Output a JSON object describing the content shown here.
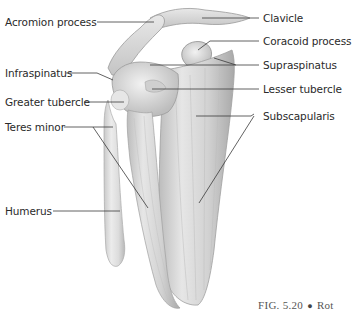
{
  "figure": {
    "labels_left": [
      {
        "id": "acromion",
        "text": "Acromion process",
        "x": 5,
        "y": 16
      },
      {
        "id": "infraspinatus",
        "text": "Infraspinatus",
        "x": 5,
        "y": 67
      },
      {
        "id": "greater-tubercle",
        "text": "Greater tubercle",
        "x": 5,
        "y": 96
      },
      {
        "id": "teres-minor",
        "text": "Teres minor",
        "x": 5,
        "y": 121
      },
      {
        "id": "humerus",
        "text": "Humerus",
        "x": 5,
        "y": 205
      }
    ],
    "labels_right": [
      {
        "id": "clavicle",
        "text": "Clavicle",
        "x": 263,
        "y": 12
      },
      {
        "id": "coracoid",
        "text": "Coracoid process",
        "x": 263,
        "y": 35
      },
      {
        "id": "supraspinatus",
        "text": "Supraspinatus",
        "x": 263,
        "y": 58
      },
      {
        "id": "lesser-tubercle",
        "text": "Lesser tubercle",
        "x": 263,
        "y": 83
      },
      {
        "id": "subscapularis",
        "text": "Subscapularis",
        "x": 263,
        "y": 109
      }
    ],
    "caption": {
      "prefix": "FIG. 5.20",
      "bullet": "●",
      "text": "Rot"
    },
    "colors": {
      "bone_light": "#ececec",
      "bone_mid": "#d4d4d4",
      "bone_dark": "#a8a8a8",
      "leader_line": "#3a3a3a",
      "label_text": "#2a2a2a"
    }
  }
}
